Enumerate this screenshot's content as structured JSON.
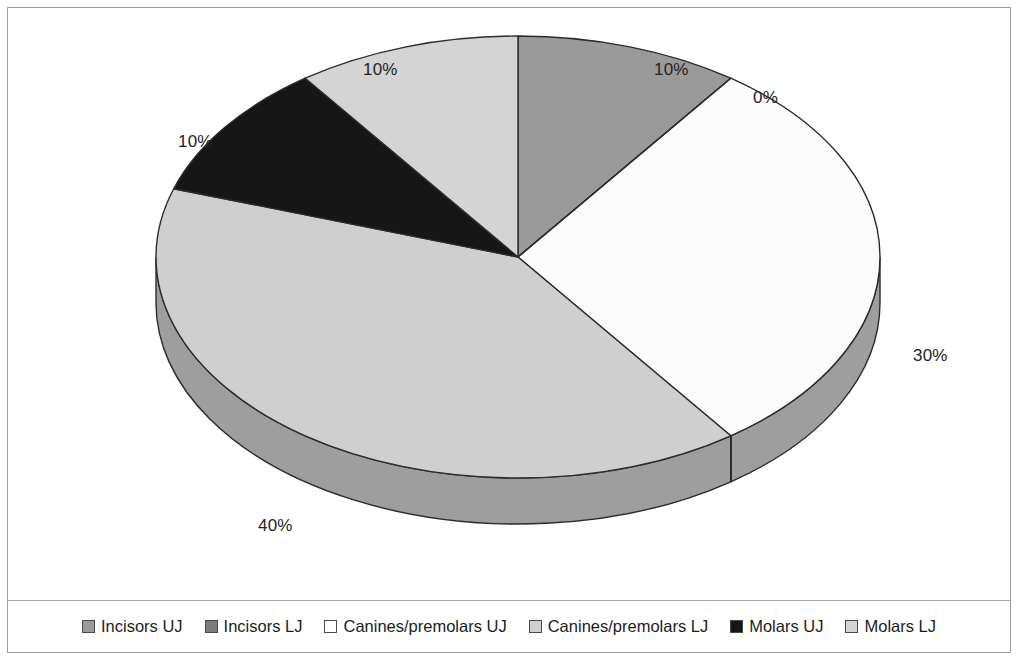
{
  "chart_data": {
    "type": "pie",
    "title": "",
    "three_d": true,
    "start_angle_deg": 0,
    "direction": "clockwise",
    "categories": [
      "Incisors UJ",
      "Incisors LJ",
      "Canines/premolars UJ",
      "Canines/premolars LJ",
      "Molars UJ",
      "Molars LJ"
    ],
    "values": [
      10,
      0,
      30,
      40,
      10,
      10
    ],
    "value_unit": "%",
    "labels": [
      "10%",
      "0%",
      "30%",
      "40%",
      "10%",
      "10%"
    ],
    "colors": [
      "#9a9a9a",
      "#7d7d7d",
      "#fbfbfb",
      "#cfcfcf",
      "#161616",
      "#d4d4d4"
    ],
    "side_colors": [
      "#8a8a8a",
      "#6e6e6e",
      "#9e9e9e",
      "#9e9e9e",
      "#0f0f0f",
      "#b0b0b0"
    ],
    "outline_color": "#2b2b2b",
    "legend_position": "bottom",
    "grid": false
  },
  "legend": {
    "items": [
      {
        "label": "Incisors UJ",
        "swatch": "#9a9a9a"
      },
      {
        "label": "Incisors LJ",
        "swatch": "#7d7d7d"
      },
      {
        "label": "Canines/premolars UJ",
        "swatch": "#ffffff"
      },
      {
        "label": "Canines/premolars LJ",
        "swatch": "#cfcfcf"
      },
      {
        "label": "Molars UJ",
        "swatch": "#161616"
      },
      {
        "label": "Molars LJ",
        "swatch": "#d4d4d4"
      }
    ]
  },
  "pct_labels": [
    {
      "name": "pct-label-incisors-uj",
      "text": "10%",
      "x": 646,
      "y": 52
    },
    {
      "name": "pct-label-incisors-lj",
      "text": "0%",
      "x": 745,
      "y": 80
    },
    {
      "name": "pct-label-canines-premolars-uj",
      "text": "30%",
      "x": 905,
      "y": 338
    },
    {
      "name": "pct-label-canines-premolars-lj",
      "text": "40%",
      "x": 250,
      "y": 508
    },
    {
      "name": "pct-label-molars-uj",
      "text": "10%",
      "x": 170,
      "y": 124
    },
    {
      "name": "pct-label-molars-lj",
      "text": "10%",
      "x": 355,
      "y": 52
    }
  ]
}
